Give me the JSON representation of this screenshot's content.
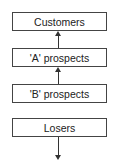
{
  "diagram": {
    "nodes": [
      {
        "id": "customers",
        "label": "Customers"
      },
      {
        "id": "a-prospects",
        "label": "'A' prospects"
      },
      {
        "id": "b-prospects",
        "label": "'B' prospects"
      },
      {
        "id": "losers",
        "label": "Losers"
      }
    ],
    "edges": [
      {
        "from": "a-prospects",
        "to": "customers",
        "direction": "up"
      },
      {
        "from": "b-prospects",
        "to": "a-prospects",
        "direction": "up"
      },
      {
        "from": "losers",
        "to": "out",
        "direction": "down"
      }
    ]
  }
}
